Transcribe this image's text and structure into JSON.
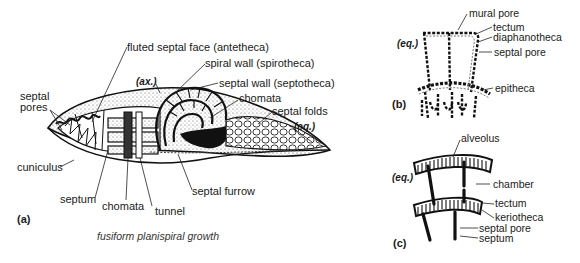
{
  "figure": {
    "panels": {
      "a": "(a)",
      "b": "(b)",
      "c": "(c)"
    },
    "caption_a": "fusiform planispiral growth",
    "panel_a_labels": {
      "fluted_septal_face": "fluted septal face (antetheca)",
      "spiral_wall": "spiral wall (spirotheca)",
      "axis": "(ax.)",
      "septal_wall": "septal wall (septotheca)",
      "septal_pores": "septal\npores",
      "septal_pores_line1": "septal",
      "septal_pores_line2": "pores",
      "chomata_top": "chomata",
      "septal_folds": "septal folds",
      "equator": "(eq.)",
      "cuniculus": "cuniculus",
      "septum": "septum",
      "chomata_bottom": "chomata",
      "tunnel": "tunnel",
      "septal_furrow": "septal furrow"
    },
    "panel_b_labels": {
      "equator": "(eq.)",
      "mural_pore": "mural pore",
      "tectum": "tectum",
      "diaphanotheca": "diaphanotheca",
      "septal_pore": "septal pore",
      "epitheca": "epitheca"
    },
    "panel_c_labels": {
      "equator": "(eq.)",
      "alveolus": "alveolus",
      "chamber": "chamber",
      "tectum": "tectum",
      "keriotheca": "keriotheca",
      "septal_pore": "septal pore",
      "septum": "septum"
    }
  }
}
